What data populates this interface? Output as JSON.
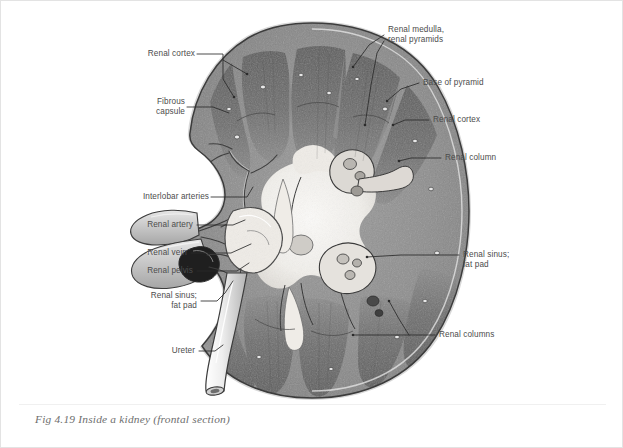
{
  "figure": {
    "caption": "Fig 4.19 Inside a kidney (frontal section)",
    "illustration_name": "kidney-frontal-section",
    "style": "grayscale anatomical illustration",
    "colors": {
      "page_background": "#ffffff",
      "page_border": "#e3e3e3",
      "label_text": "#4c4c4c",
      "caption_text": "#6e6e6e",
      "leader_line": "#2b2b2b",
      "capsule_outline": "#4a4a4a",
      "cortex_fill": "#8b8b8b",
      "medulla_fill": "#6a6a6a",
      "sinus_fill": "#f2f0ec",
      "vessel_fill": "#c9c9c9"
    }
  },
  "labels": {
    "left": [
      {
        "id": "renal-cortex-left",
        "text": "Renal cortex"
      },
      {
        "id": "fibrous-capsule",
        "text": "Fibrous\ncapsule"
      },
      {
        "id": "interlobar-arteries",
        "text": "Interlobar arteries"
      },
      {
        "id": "renal-artery",
        "text": "Renal artery"
      },
      {
        "id": "renal-vein",
        "text": "Renal vein"
      },
      {
        "id": "renal-pelvis",
        "text": "Renal pelvis"
      },
      {
        "id": "renal-sinus-fat-pad-left",
        "text": "Renal sinus;\nfat pad"
      },
      {
        "id": "ureter",
        "text": "Ureter"
      }
    ],
    "right": [
      {
        "id": "renal-medulla-pyramids",
        "text": "Renal medulla,\nrenal pyramids"
      },
      {
        "id": "base-of-pyramid",
        "text": "Base of pyramid"
      },
      {
        "id": "renal-cortex-right",
        "text": "Renal cortex"
      },
      {
        "id": "renal-column",
        "text": "Renal column"
      },
      {
        "id": "renal-sinus-fat-pad-right",
        "text": "Renal sinus;\nfat pad"
      },
      {
        "id": "renal-columns",
        "text": "Renal columns"
      }
    ]
  }
}
